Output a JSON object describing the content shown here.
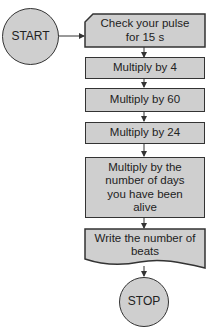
{
  "flowchart": {
    "start": {
      "label": "START"
    },
    "steps": [
      {
        "label": "Check your pulse for 15 s",
        "shape": "manual-input"
      },
      {
        "label": "Multiply by 4",
        "shape": "process"
      },
      {
        "label": "Multiply by 60",
        "shape": "process"
      },
      {
        "label": "Multiply by 24",
        "shape": "process"
      },
      {
        "label": "Multiply by the number of days you have been alive",
        "shape": "process"
      },
      {
        "label": "Write the number of beats",
        "shape": "document"
      }
    ],
    "stop": {
      "label": "STOP"
    }
  },
  "colors": {
    "fill": "#cfcfcf",
    "stroke": "#333333",
    "background": "#ffffff"
  }
}
